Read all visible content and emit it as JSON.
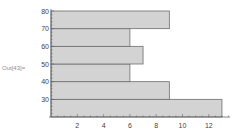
{
  "cell_label": "Out[43]=",
  "colors": {
    "bar_fill": "#d3d3d3",
    "bar_edge": "#6e6e6e",
    "axis": "#555555",
    "tick_label": "#444444"
  },
  "chart_data": {
    "type": "bar",
    "orientation": "horizontal",
    "title": "",
    "xlabel": "",
    "ylabel": "",
    "bins": [
      {
        "from": 20,
        "to": 30,
        "count": 13
      },
      {
        "from": 30,
        "to": 40,
        "count": 9
      },
      {
        "from": 40,
        "to": 50,
        "count": 6
      },
      {
        "from": 50,
        "to": 60,
        "count": 7
      },
      {
        "from": 60,
        "to": 70,
        "count": 6
      },
      {
        "from": 70,
        "to": 80,
        "count": 9
      }
    ],
    "categories": [
      "20-30",
      "30-40",
      "40-50",
      "50-60",
      "60-70",
      "70-80"
    ],
    "values": [
      13,
      9,
      6,
      7,
      6,
      9
    ],
    "xlim": [
      0,
      13.5
    ],
    "ylim": [
      20,
      80
    ],
    "x_ticks": [
      2,
      4,
      6,
      8,
      10,
      12
    ],
    "y_ticks": [
      30,
      40,
      50,
      60,
      70,
      80
    ],
    "grid": false,
    "legend": null
  }
}
